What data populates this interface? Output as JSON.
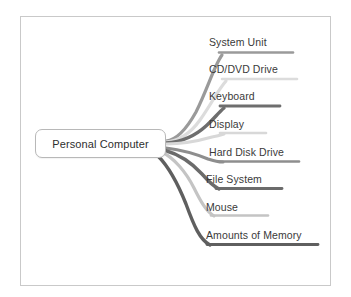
{
  "diagram": {
    "type": "mind-map",
    "frame": {
      "border_color": "#c9c9c9",
      "background": "#ffffff"
    },
    "center": {
      "label": "Personal Computer",
      "fill": "#ffffff",
      "border_color": "#b8b8b8",
      "text_color": "#2e2e2e"
    },
    "branches": [
      {
        "label": "System Unit",
        "color": "#9a9a9a",
        "order": 1
      },
      {
        "label": "CD/DVD Drive",
        "color": "#dcdcdc",
        "order": 2
      },
      {
        "label": "Keyboard",
        "color": "#6e6e6e",
        "order": 3
      },
      {
        "label": "Display",
        "color": "#d8d8d8",
        "order": 4
      },
      {
        "label": "Hard Disk Drive",
        "color": "#8e8e8e",
        "order": 5
      },
      {
        "label": "File System",
        "color": "#6b6b6b",
        "order": 6
      },
      {
        "label": "Mouse",
        "color": "#c4c4c4",
        "order": 7
      },
      {
        "label": "Amounts of Memory",
        "color": "#5f5f5f",
        "order": 8
      }
    ]
  }
}
